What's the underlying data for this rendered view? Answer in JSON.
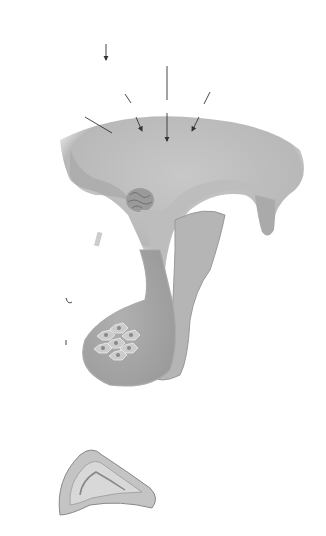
{
  "diagram": {
    "labels": {
      "circadian_line1": "Circadian",
      "circadian_line2": "rhythm",
      "stress_line1": "Stress",
      "stress_line2": "inputs",
      "scn_line1": "Suprachiasmatic",
      "scn_line2": "nucleus",
      "hippocampus": "Hippocampus",
      "hypothalamus": "Hypothalamus",
      "crh": "CRH and/or AVP",
      "anterior_line1": "Anterior",
      "anterior_line2": "pituitary",
      "corticotrophs": "Corticotrophs",
      "acth": "ACTH",
      "free_cortisol": "Free cortisol",
      "adrenal_line1": "Adrenal",
      "adrenal_line2": "zona reticularis",
      "short_feedback": "Short feedback",
      "long_feedback": "Long feedback"
    },
    "signs": {
      "plus": "+",
      "minus": "−"
    },
    "colors": {
      "line": "#333333",
      "tissue_light": "#d4d4d4",
      "tissue_mid": "#b5b5b5",
      "tissue_dark": "#8f8f8f"
    }
  }
}
